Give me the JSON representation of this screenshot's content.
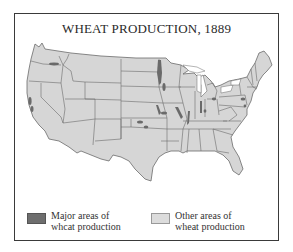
{
  "title": "WHEAT PRODUCTION, 1889",
  "colors": {
    "frame": "#3a3a3a",
    "background": "#ffffff",
    "land_other": "#d6d6d6",
    "state_border": "#6b6b6b",
    "major_wheat": "#6a6a6a"
  },
  "legend": {
    "items": [
      {
        "label_line1": "Major areas of",
        "label_line2": "whcat production",
        "swatch_color": "#6e6e6e"
      },
      {
        "label_line1": "Other areas of",
        "label_line2": "wheat production",
        "swatch_color": "#dcdcdc"
      }
    ]
  },
  "map": {
    "region": "United States",
    "major_areas": [
      "Red River Valley (Minnesota / North Dakota border)",
      "Southern Minnesota",
      "Central Kansas",
      "Eastern Nebraska / Kansas border",
      "Illinois / Missouri river corridor",
      "Southern Illinois",
      "Indiana",
      "Ohio",
      "Southeastern Pennsylvania",
      "Maryland",
      "Central Valley of California",
      "Eastern Washington (Palouse)"
    ]
  }
}
